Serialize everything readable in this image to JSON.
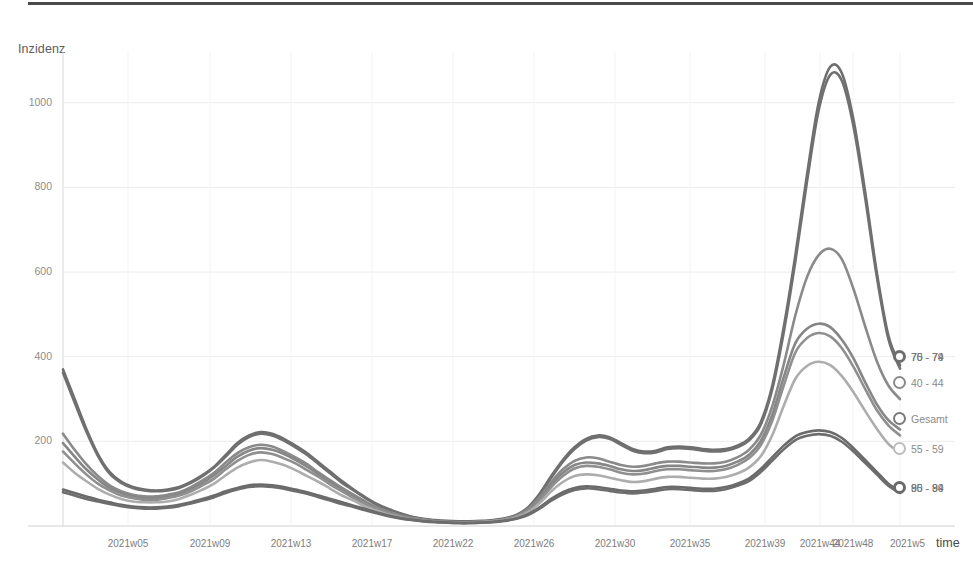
{
  "chart_data": {
    "type": "line",
    "title": "",
    "ylabel": "Inzidenz",
    "xlabel": "time",
    "ylim": [
      0,
      1120
    ],
    "yticks": [
      200,
      400,
      600,
      800,
      1000
    ],
    "grid": true,
    "legend_position": "right-inline-end-of-line",
    "x_tick_labels": [
      "2021w05",
      "2021w09",
      "2021w13",
      "2021w17",
      "2021w22",
      "2021w26",
      "2021w30",
      "2021w35",
      "2021w39",
      "2021w44",
      "2021w48",
      "2021w5"
    ],
    "x_tick_positions": [
      128,
      210,
      291,
      372,
      453,
      534,
      615,
      690,
      765,
      820,
      853,
      900
    ],
    "series": [
      {
        "name": "70 - 74",
        "color": "#6e6e6e",
        "end_value": 380,
        "values": [
          370,
          300,
          230,
          170,
          128,
          105,
          92,
          86,
          84,
          86,
          92,
          104,
          120,
          140,
          168,
          196,
          214,
          222,
          218,
          206,
          190,
          172,
          150,
          128,
          106,
          86,
          68,
          52,
          40,
          30,
          22,
          17,
          14,
          12,
          11,
          11,
          12,
          14,
          18,
          26,
          44,
          76,
          118,
          156,
          186,
          206,
          214,
          210,
          196,
          182,
          176,
          178,
          186,
          188,
          186,
          182,
          180,
          182,
          190,
          206,
          244,
          330,
          470,
          640,
          830,
          1000,
          1085,
          1070,
          960,
          790,
          600,
          450,
          380
        ]
      },
      {
        "name": "75 - 79",
        "color": "#707070",
        "end_value": 372,
        "values": [
          362,
          292,
          224,
          166,
          124,
          102,
          90,
          84,
          82,
          84,
          90,
          102,
          118,
          138,
          164,
          192,
          210,
          218,
          214,
          202,
          186,
          168,
          146,
          124,
          102,
          84,
          66,
          50,
          38,
          29,
          21,
          16,
          13,
          11,
          10,
          10,
          11,
          13,
          17,
          25,
          42,
          73,
          114,
          152,
          182,
          202,
          210,
          206,
          192,
          178,
          172,
          174,
          182,
          184,
          182,
          178,
          176,
          178,
          186,
          202,
          238,
          322,
          458,
          626,
          814,
          982,
          1066,
          1052,
          944,
          776,
          590,
          442,
          372
        ]
      },
      {
        "name": "40 - 44",
        "color": "#8a8a8a",
        "end_value": 300,
        "values": [
          218,
          180,
          146,
          118,
          96,
          82,
          74,
          70,
          70,
          74,
          80,
          92,
          108,
          126,
          150,
          172,
          186,
          192,
          188,
          176,
          162,
          146,
          126,
          108,
          90,
          74,
          58,
          44,
          34,
          25,
          19,
          15,
          12,
          10,
          9,
          9,
          10,
          12,
          16,
          24,
          40,
          68,
          104,
          134,
          154,
          162,
          160,
          152,
          144,
          140,
          142,
          148,
          152,
          152,
          150,
          148,
          148,
          152,
          162,
          180,
          214,
          282,
          382,
          498,
          588,
          640,
          655,
          630,
          560,
          472,
          390,
          332,
          300
        ]
      },
      {
        "name": "Gesamt",
        "color": "#868686",
        "end_value": 228,
        "values": [
          196,
          164,
          134,
          110,
          90,
          78,
          70,
          66,
          66,
          70,
          76,
          88,
          102,
          120,
          142,
          164,
          178,
          184,
          180,
          170,
          156,
          140,
          122,
          104,
          86,
          70,
          56,
          42,
          32,
          24,
          18,
          14,
          11,
          10,
          9,
          9,
          10,
          12,
          16,
          23,
          38,
          64,
          98,
          126,
          144,
          150,
          148,
          142,
          134,
          130,
          132,
          138,
          142,
          142,
          140,
          138,
          138,
          142,
          152,
          168,
          200,
          262,
          352,
          432,
          466,
          478,
          470,
          440,
          396,
          340,
          288,
          250,
          228
        ]
      },
      {
        "name": "50 - 54",
        "color": "#8f8f8f",
        "end_value": 214,
        "values": [
          176,
          148,
          122,
          100,
          84,
          72,
          66,
          62,
          62,
          66,
          72,
          82,
          96,
          112,
          134,
          154,
          168,
          174,
          170,
          160,
          148,
          132,
          116,
          98,
          82,
          66,
          52,
          40,
          30,
          23,
          17,
          13,
          11,
          9,
          9,
          9,
          10,
          12,
          15,
          22,
          36,
          60,
          92,
          118,
          136,
          142,
          140,
          134,
          126,
          122,
          124,
          130,
          134,
          134,
          132,
          130,
          130,
          134,
          144,
          160,
          190,
          248,
          332,
          410,
          444,
          456,
          448,
          420,
          376,
          324,
          274,
          238,
          214
        ]
      },
      {
        "name": "55 - 59",
        "color": "#adadad",
        "end_value": 172,
        "values": [
          150,
          126,
          106,
          88,
          74,
          64,
          58,
          56,
          56,
          58,
          64,
          74,
          86,
          100,
          120,
          138,
          150,
          156,
          152,
          144,
          132,
          118,
          104,
          88,
          72,
          60,
          46,
          36,
          27,
          20,
          15,
          12,
          10,
          8,
          8,
          8,
          9,
          11,
          14,
          20,
          32,
          54,
          82,
          104,
          118,
          122,
          120,
          114,
          108,
          104,
          106,
          112,
          116,
          116,
          114,
          112,
          112,
          116,
          124,
          138,
          164,
          214,
          284,
          348,
          378,
          388,
          380,
          354,
          316,
          272,
          230,
          194,
          172
        ]
      },
      {
        "name": "90 - 94",
        "color": "#6a6a6a",
        "end_value": 84,
        "values": [
          86,
          78,
          70,
          62,
          56,
          50,
          46,
          44,
          44,
          46,
          50,
          56,
          64,
          72,
          82,
          90,
          96,
          98,
          96,
          92,
          86,
          80,
          72,
          64,
          56,
          48,
          40,
          32,
          25,
          19,
          15,
          12,
          10,
          8,
          7,
          7,
          8,
          10,
          13,
          18,
          28,
          44,
          64,
          80,
          90,
          94,
          92,
          88,
          84,
          82,
          84,
          88,
          92,
          92,
          90,
          88,
          88,
          92,
          100,
          112,
          134,
          162,
          190,
          212,
          222,
          226,
          222,
          208,
          184,
          156,
          128,
          100,
          84
        ]
      },
      {
        "name": "85 - 89",
        "color": "#6d6d6d",
        "end_value": 78,
        "values": [
          80,
          72,
          64,
          58,
          52,
          47,
          43,
          41,
          41,
          43,
          47,
          53,
          60,
          68,
          78,
          86,
          92,
          94,
          92,
          88,
          82,
          76,
          68,
          60,
          52,
          45,
          37,
          30,
          23,
          18,
          14,
          11,
          9,
          8,
          7,
          7,
          8,
          9,
          12,
          17,
          26,
          41,
          60,
          75,
          85,
          89,
          87,
          83,
          79,
          77,
          79,
          83,
          87,
          87,
          85,
          83,
          83,
          87,
          95,
          106,
          127,
          154,
          181,
          203,
          213,
          217,
          213,
          199,
          176,
          149,
          122,
          95,
          78
        ]
      }
    ],
    "legend_entries": [
      {
        "label": "70 - 74",
        "overlapping_label": "75 - 79",
        "overlapped": true,
        "dot_color": "#6e6e6e",
        "y": 357
      },
      {
        "label": "40 - 44",
        "overlapping_label": "",
        "overlapped": false,
        "dot_color": "#8a8a8a",
        "y": 383
      },
      {
        "label": "Gesamt",
        "overlapping_label": "",
        "overlapped": false,
        "dot_color": "#7a7a7a",
        "y": 419
      },
      {
        "label": "55 - 59",
        "overlapping_label": "",
        "overlapped": false,
        "dot_color": "#bdbdbd",
        "y": 449
      },
      {
        "label": "90 - 94",
        "overlapping_label": "85 - 89",
        "overlapped": true,
        "dot_color": "#6a6a6a",
        "y": 488
      }
    ]
  }
}
